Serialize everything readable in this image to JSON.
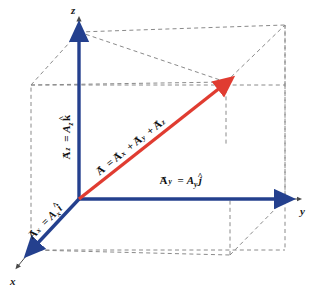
{
  "figure": {
    "background_color": "#ffffff",
    "width": 316,
    "height": 291
  },
  "colors": {
    "component_vector_blue": "#24408E",
    "resultant_vector_red": "#E03C31",
    "axis_line_gray": "#4a4a4a",
    "box_dashed_gray": "#8a8a8a",
    "text_black": "#111111"
  },
  "axes": [
    {
      "id": "x",
      "label": "x",
      "label_x": 12,
      "label_y": 283
    },
    {
      "id": "y",
      "label": "y",
      "label_x": 302,
      "label_y": 210
    },
    {
      "id": "z",
      "label": "z",
      "label_x": 71,
      "label_y": 12
    }
  ],
  "vectors": [
    {
      "id": "A_x",
      "color": "#24408E",
      "label_parts": {
        "head": "A",
        "sub1": "x",
        "equals": "=",
        "mag": "A",
        "sub2": "x",
        "unit": "i"
      },
      "label_text": "A⃗x = Ax î",
      "rotation_deg": -45,
      "label_x": 46,
      "label_y": 226
    },
    {
      "id": "A_y",
      "color": "#24408E",
      "label_parts": {
        "head": "A",
        "sub1": "y",
        "equals": "=",
        "mag": "A",
        "sub2": "y",
        "unit": "j"
      },
      "label_text": "A⃗y = Ay ĵ",
      "rotation_deg": 0,
      "label_x": 160,
      "label_y": 186
    },
    {
      "id": "A_z",
      "color": "#24408E",
      "label_parts": {
        "head": "A",
        "sub1": "z",
        "equals": "=",
        "mag": "A",
        "sub2": "z",
        "unit": "k"
      },
      "label_text": "A⃗z = Az k̂",
      "rotation_deg": -90,
      "label_x": 70,
      "label_y": 160
    },
    {
      "id": "A_resultant",
      "color": "#E03C31",
      "label_parts": {
        "head": "A",
        "equals": "=",
        "term1": "A",
        "sub1": "x",
        "plus1": "+",
        "term2": "A",
        "sub2": "y",
        "plus2": "+",
        "term3": "A",
        "sub3": "z"
      },
      "label_text": "A⃗ = A⃗x + A⃗y + A⃗z",
      "rotation_deg": -40,
      "label_x": 103,
      "label_y": 172
    }
  ],
  "geometry": {
    "origin": {
      "x": 79,
      "y": 199
    },
    "x_axis_tip": {
      "x": 31,
      "y": 250
    },
    "y_axis_tip": {
      "x": 285,
      "y": 199
    },
    "z_axis_tip": {
      "x": 79,
      "y": 32
    },
    "resultant_tip": {
      "x": 226,
      "y": 82
    },
    "box_corners": {
      "front_bottom_left": {
        "x": 31,
        "y": 250
      },
      "front_bottom_right": {
        "x": 285,
        "y": 250
      },
      "front_top_left": {
        "x": 31,
        "y": 85
      },
      "front_top_right": {
        "x": 285,
        "y": 85
      },
      "back_bottom_left": {
        "x": 79,
        "y": 199
      },
      "back_bottom_right": {
        "x": 285,
        "y": 199
      },
      "back_top_left": {
        "x": 79,
        "y": 32
      },
      "back_top_right": {
        "x": 285,
        "y": 25
      }
    }
  }
}
